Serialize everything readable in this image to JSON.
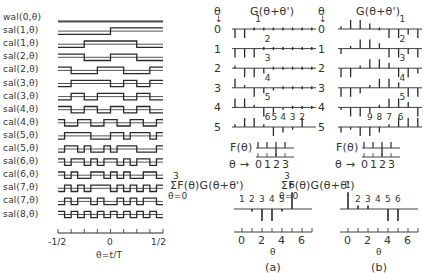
{
  "left_panel": {
    "functions": [
      {
        "label": "wal(0,θ)",
        "seq": "0000000000000000"
      },
      {
        "label": "sal(1,θ)",
        "seq": "0000000011111111"
      },
      {
        "label": "cal(1,θ)",
        "seq": "0000111111110000"
      },
      {
        "label": "sal(2,θ)",
        "seq": "1111000011110000"
      },
      {
        "label": "cal(2,θ)",
        "seq": "1100001111000011"
      },
      {
        "label": "sal(3,θ)",
        "seq": "0011111100110011"
      },
      {
        "label": "cal(3,θ)",
        "seq": "0011001111001100"
      },
      {
        "label": "sal(4,θ)",
        "seq": "1100110011001100"
      },
      {
        "label": "cal(4,θ)",
        "seq": "1001100110011001"
      },
      {
        "label": "sal(5,θ)",
        "seq": "0111100011011101"
      },
      {
        "label": "cal(5,θ)",
        "seq": "0110100101110001"
      },
      {
        "label": "sal(6,θ)",
        "seq": "1011010110101101"
      },
      {
        "label": "cal(6,θ)",
        "seq": "1010011010100110"
      },
      {
        "label": "sal(7,θ)",
        "seq": "0101011101010101"
      },
      {
        "label": "cal(7,θ)",
        "seq": "0101101001010110"
      },
      {
        "label": "sal(8,θ)",
        "seq": "1010101010101010"
      }
    ],
    "axis": {
      "min_label": "-1/2",
      "mid_label": "0",
      "max_label": "1/2",
      "xlabel": "θ=t/T"
    }
  },
  "panel_a": {
    "caption": "(a)",
    "theta_header": "θ",
    "g_header": "G(θ+θ')",
    "rows": [
      {
        "theta": "0",
        "bars": [
          -1,
          -1,
          0,
          0,
          0,
          0,
          0,
          0,
          0
        ],
        "marks": [
          {
            "i": 2,
            "t": "1"
          }
        ]
      },
      {
        "theta": "1",
        "bars": [
          -1,
          -1,
          -1,
          0,
          0,
          0,
          0,
          0,
          0
        ],
        "marks": [
          {
            "i": 3,
            "t": "2"
          }
        ]
      },
      {
        "theta": "2",
        "bars": [
          0.3,
          -1,
          -1,
          -0.6,
          0,
          0,
          0,
          0,
          0
        ],
        "marks": [
          {
            "i": 3,
            "t": "3"
          }
        ]
      },
      {
        "theta": "3",
        "bars": [
          1,
          0.3,
          -1,
          -0.6,
          -0.3,
          0,
          0,
          0,
          0
        ],
        "marks": [
          {
            "i": 3,
            "t": "4"
          }
        ]
      },
      {
        "theta": "4",
        "bars": [
          1,
          1,
          0.3,
          -1,
          -0.6,
          -0.3,
          0,
          0,
          0
        ],
        "marks": [
          {
            "i": 3,
            "t": "5"
          }
        ]
      },
      {
        "theta": "5",
        "bars": [
          0.3,
          1,
          1,
          0.3,
          -1,
          -0.6,
          -0.3,
          1
        ],
        "marks": [
          {
            "i": 3,
            "t": "6"
          },
          {
            "i": 3.7,
            "t": "5"
          },
          {
            "i": 4.6,
            "t": "4"
          },
          {
            "i": 5.6,
            "t": "3"
          },
          {
            "i": 6.6,
            "t": "2"
          }
        ]
      }
    ],
    "f_label": "F(θ)",
    "f_axis_label": "θ →",
    "f_ticks": [
      "0",
      "1",
      "2",
      "3"
    ],
    "sum_label_top": "3",
    "sum_label": "ΣF(θ)G(θ+θ')",
    "sum_label_bottom": "θ=0",
    "result_marks": [
      "1",
      "2",
      "3",
      "4",
      "5",
      "6"
    ],
    "result_bars": [
      0,
      -0.2,
      -1,
      -1,
      -0.2,
      1.4
    ],
    "axis_ticks": [
      "0",
      "2",
      "4",
      "6"
    ],
    "xlabel": "θ"
  },
  "panel_b": {
    "caption": "(b)",
    "theta_header": "θ",
    "g_header": "G(θ+θ')",
    "rows": [
      {
        "theta": "0",
        "bars": [
          0.3,
          1,
          1,
          0.6,
          0,
          -1,
          -1,
          -0.6,
          -1
        ],
        "marks": [
          {
            "i": 6,
            "t": "1"
          }
        ]
      },
      {
        "theta": "1",
        "bars": [
          -0.6,
          0.3,
          1,
          1,
          0.6,
          -1,
          -1,
          -0.6,
          -1
        ],
        "marks": [
          {
            "i": 6,
            "t": "2"
          }
        ]
      },
      {
        "theta": "2",
        "bars": [
          -1,
          -1,
          0.3,
          1,
          1,
          0.6,
          -1,
          -1,
          -0.6
        ],
        "marks": [
          {
            "i": 6,
            "t": "3"
          }
        ]
      },
      {
        "theta": "3",
        "bars": [
          -1,
          -1,
          -0.6,
          0.3,
          1,
          1,
          0.6,
          -1,
          -1
        ],
        "marks": [
          {
            "i": 6,
            "t": "4"
          }
        ]
      },
      {
        "theta": "4",
        "bars": [
          -0.3,
          -1,
          -1,
          -0.6,
          0.3,
          1,
          1,
          0.6,
          -1
        ],
        "marks": [
          {
            "i": 6,
            "t": "5"
          }
        ]
      },
      {
        "theta": "5",
        "bars": [
          -0.6,
          -0.3,
          -1,
          -1,
          -0.6,
          0.3,
          1,
          1,
          1
        ],
        "marks": [
          {
            "i": 2.6,
            "t": "9"
          },
          {
            "i": 3.6,
            "t": "8"
          },
          {
            "i": 4.6,
            "t": "7"
          },
          {
            "i": 5.8,
            "t": "6"
          }
        ]
      }
    ],
    "f_label": "F(θ)",
    "f_axis_label": "θ →",
    "f_ticks": [
      "0",
      "1",
      "2",
      "3"
    ],
    "sum_label_top": "3",
    "sum_label": "ΣF(θ)G(θ+θ')",
    "sum_label_bottom": "θ=0",
    "result_marks": [
      "1",
      "2",
      "3",
      "4",
      "5",
      "6"
    ],
    "result_bars": [
      1.4,
      0.3,
      0.3,
      0,
      -1,
      -1
    ],
    "axis_ticks": [
      "0",
      "2",
      "4",
      "6"
    ],
    "xlabel": "θ"
  }
}
